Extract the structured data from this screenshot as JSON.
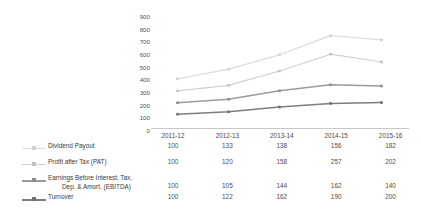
{
  "chart_data": {
    "type": "line",
    "title": "",
    "subtitle": "",
    "xlabel": "",
    "ylabel": "",
    "ylim": [
      0,
      900
    ],
    "yticks": [
      900,
      800,
      700,
      600,
      500,
      400,
      300,
      200,
      100,
      0
    ],
    "grid": false,
    "legend_position": "bottom-left",
    "categories": [
      "2011-12",
      "2012-13",
      "2013-14",
      "2014-15",
      "2015-16"
    ],
    "series": [
      {
        "name": "Dividend Payout",
        "color": "#dcdcdc",
        "marker_color": "#d0d0d0",
        "plotted_values": [
          410,
          490,
          610,
          770,
          735
        ],
        "table_values": [
          "100",
          "133",
          "138",
          "156",
          "182"
        ]
      },
      {
        "name": "Profit after Tax (PAT)",
        "color": "#cfcfcf",
        "marker_color": "#c2c2c2",
        "plotted_values": [
          310,
          355,
          475,
          615,
          550
        ],
        "table_values": [
          "100",
          "120",
          "158",
          "257",
          "202"
        ]
      },
      {
        "name": "Earnings Before Interest, Tax,",
        "name_line2": "Dep. & Amort. (EBITDA)",
        "color": "#9a9a9a",
        "marker_color": "#8c8c8c",
        "plotted_values": [
          210,
          240,
          310,
          360,
          350
        ],
        "table_values": [
          "100",
          "105",
          "144",
          "162",
          "140"
        ]
      },
      {
        "name": "Turnover",
        "color": "#7d7d7d",
        "marker_color": "#6f6f6f",
        "plotted_values": [
          115,
          135,
          175,
          205,
          212
        ],
        "table_values": [
          "100",
          "122",
          "162",
          "190",
          "200"
        ]
      }
    ]
  },
  "colors": {
    "background": "#ffffff",
    "axis": "#c8c8c8",
    "text": "#4a4a4a"
  }
}
